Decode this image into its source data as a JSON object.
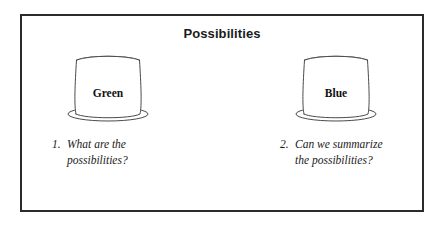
{
  "figure": {
    "title": "Possibilities",
    "border_color": "#2b2b2b",
    "background_color": "#ffffff",
    "line_color": "#4a4a4a"
  },
  "columns": [
    {
      "hat_icon": "top-hat-icon",
      "hat_label": "Green",
      "caption": {
        "number": "1.",
        "line1": "What are the",
        "line2": "possibilities?"
      }
    },
    {
      "hat_icon": "top-hat-icon",
      "hat_label": "Blue",
      "caption": {
        "number": "2.",
        "line1": "Can we summarize",
        "line2": "the possibilities?"
      }
    }
  ]
}
